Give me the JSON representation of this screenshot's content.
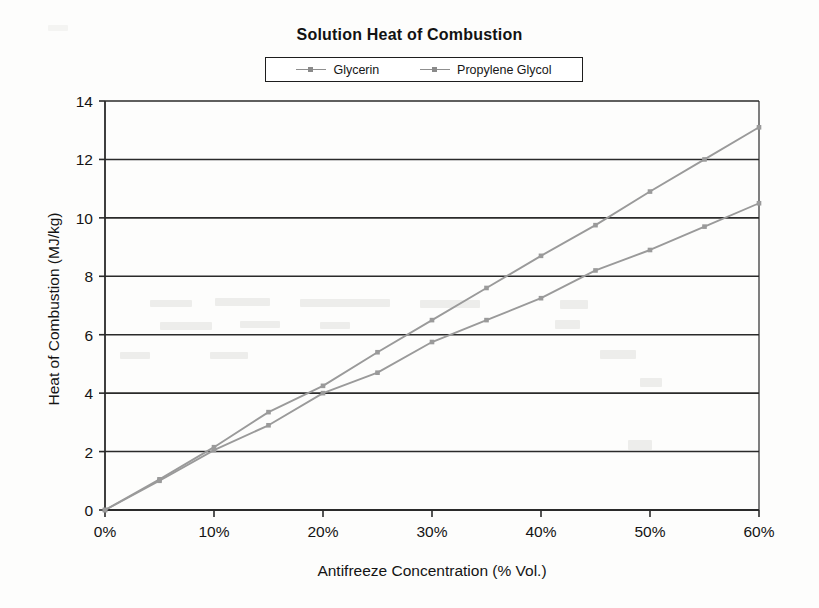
{
  "chart_data": {
    "type": "line",
    "title": "Solution Heat of Combustion",
    "xlabel": "Antifreeze Concentration (% Vol.)",
    "ylabel": "Heat of Combustion (MJ/kg)",
    "xlim": [
      0,
      60
    ],
    "ylim": [
      0,
      14
    ],
    "xticks": [
      0,
      10,
      20,
      30,
      40,
      50,
      60
    ],
    "xtick_labels": [
      "0%",
      "10%",
      "20%",
      "30%",
      "40%",
      "50%",
      "60%"
    ],
    "yticks": [
      0,
      2,
      4,
      6,
      8,
      10,
      12,
      14
    ],
    "ytick_labels": [
      "0",
      "2",
      "4",
      "6",
      "8",
      "10",
      "12",
      "14"
    ],
    "grid": "horizontal",
    "legend_position": "top-center",
    "x": [
      0,
      5,
      10,
      15,
      20,
      25,
      30,
      35,
      40,
      45,
      50,
      55,
      60
    ],
    "series": [
      {
        "name": "Glycerin",
        "color": "#9a9a9a",
        "marker": "square",
        "values": [
          0,
          1.05,
          2.15,
          3.35,
          4.25,
          5.4,
          6.5,
          7.6,
          8.7,
          9.75,
          10.9,
          12.0,
          13.1
        ]
      },
      {
        "name": "Propylene Glycol",
        "color": "#9a9a9a",
        "marker": "square",
        "values": [
          0,
          1.0,
          2.05,
          2.9,
          4.0,
          4.7,
          5.75,
          6.5,
          7.25,
          8.2,
          8.9,
          9.7,
          10.5
        ]
      }
    ]
  },
  "legend": {
    "entries": [
      {
        "label": "Glycerin"
      },
      {
        "label": "Propylene Glycol"
      }
    ]
  }
}
